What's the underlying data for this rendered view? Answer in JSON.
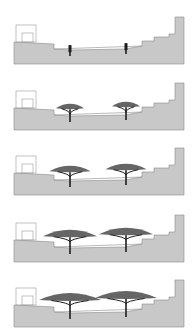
{
  "diagram": {
    "type": "section-sequence",
    "colors": {
      "ground": "#c8c8c8",
      "ground_edge": "#8a8a8a",
      "outline": "#9a9a9a",
      "tree": "#1e1e1e",
      "canopy": "#4a4a4a",
      "background": "#ffffff"
    },
    "stages": [
      {
        "id": 1,
        "label": "",
        "tree_growth": 0.1,
        "has_canopy": false
      },
      {
        "id": 2,
        "label": "",
        "tree_growth": 0.35,
        "has_canopy": true
      },
      {
        "id": 3,
        "label": "",
        "tree_growth": 0.6,
        "has_canopy": true
      },
      {
        "id": 4,
        "label": "",
        "tree_growth": 0.85,
        "has_canopy": true
      },
      {
        "id": 5,
        "label": "",
        "tree_growth": 1.0,
        "has_canopy": true
      }
    ]
  }
}
